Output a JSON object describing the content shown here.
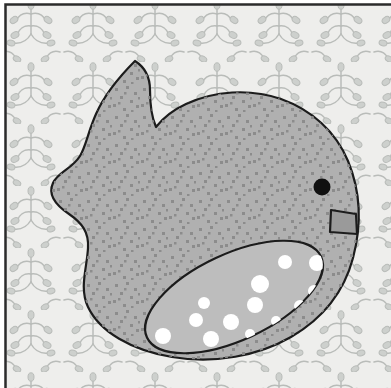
{
  "artwork": {
    "title": "Stylized Bird on Patterned Background",
    "medium": "flat vector illustration",
    "canvas": {
      "width": 391,
      "height": 388
    },
    "alt_text": "A large grey speckled bird with a round body, small dark eye, angular beak and a spotted wing, set against a pale background covered in a repeating grey vine-and-leaf pattern, enclosed by a thin dark border on the top and left edges."
  },
  "palette": {
    "paper": "#ffffff",
    "border": "#2b2b2b",
    "background_fill": "#eeeeec",
    "pattern_stroke": "#b9bcb9",
    "body_fill": "#b0b0b0",
    "body_outline": "#1c1c1c",
    "body_speckle": "#8a8a8a",
    "wing_fill": "#bdbdbd",
    "wing_outline": "#1c1c1c",
    "wing_spot": "#ffffff",
    "eye_fill": "#111111",
    "beak_fill": "#9a9a9a",
    "beak_outline": "#1c1c1c"
  },
  "layout": {
    "border": {
      "x": 4,
      "y": 3,
      "width": 386,
      "height": 385,
      "stroke_width": 2.5
    },
    "background_rect": {
      "x": 6,
      "y": 5,
      "width": 385,
      "height": 383
    }
  },
  "elements": {
    "background_label": "patterned wallpaper background",
    "bird_label": "bird silhouette",
    "wing_label": "spotted wing",
    "eye_label": "bird eye",
    "beak_label": "bird beak"
  },
  "shapes": {
    "bird_body_path": "M 135 61 C 118 78, 104 96, 96 114 C 88 132, 86 146, 80 156 C 72 169, 58 172, 53 183 C 47 196, 57 206, 69 214 C 82 223, 89 232, 88 248 C 87 268, 79 288, 88 307 C 100 332, 131 350, 172 357 C 215 364, 258 356, 291 337 C 322 319, 344 292, 353 258 C 362 224, 360 190, 348 161 C 336 132, 312 110, 281 99 C 249 88, 214 91, 186 104 C 173 110, 163 118, 156 127 C 152 118, 150 104, 150 90 C 150 77, 146 68, 135 61 Z",
    "wing_ellipse": {
      "cx": 234,
      "cy": 297,
      "rx": 96,
      "ry": 43,
      "rotation": -25
    },
    "eye": {
      "cx": 322,
      "cy": 187,
      "r": 8.5
    },
    "beak_path": "M 331 210 L 356 214 L 357 234 L 330 232 Z"
  },
  "wing_spots": [
    {
      "cx": 285,
      "cy": 262,
      "r": 7
    },
    {
      "cx": 317,
      "cy": 263,
      "r": 8
    },
    {
      "cx": 260,
      "cy": 284,
      "r": 9
    },
    {
      "cx": 314,
      "cy": 291,
      "r": 6
    },
    {
      "cx": 204,
      "cy": 303,
      "r": 6
    },
    {
      "cx": 255,
      "cy": 305,
      "r": 8
    },
    {
      "cx": 300,
      "cy": 306,
      "r": 6
    },
    {
      "cx": 196,
      "cy": 320,
      "r": 7
    },
    {
      "cx": 231,
      "cy": 322,
      "r": 8
    },
    {
      "cx": 276,
      "cy": 321,
      "r": 5
    },
    {
      "cx": 163,
      "cy": 336,
      "r": 8
    },
    {
      "cx": 211,
      "cy": 339,
      "r": 8
    },
    {
      "cx": 250,
      "cy": 334,
      "r": 5
    }
  ],
  "pattern": {
    "name": "vine-leaf-sprig",
    "tile_size": 62,
    "description": "repeating sprig of curved branches ending in teardrop leaves"
  },
  "speckle": {
    "name": "body-speckle",
    "dot_radius": 1.7,
    "density": "dense",
    "description": "scattered small square-ish dots over the bird body"
  }
}
